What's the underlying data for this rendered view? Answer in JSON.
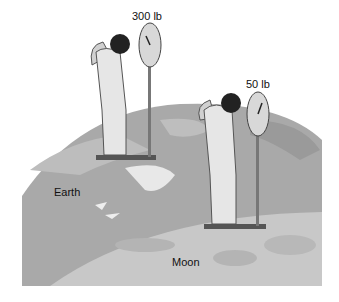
{
  "figure": {
    "earth_scale": {
      "reading": "300 lb"
    },
    "moon_scale": {
      "reading": "50 lb"
    },
    "labels": {
      "earth": "Earth",
      "moon": "Moon"
    }
  },
  "colors": {
    "earth": "#a9a9a9",
    "earth_land": "#8f8f8f",
    "moon": "#c8c8c8",
    "crater": "#b4b4b4",
    "suit": "#e6e6e6",
    "outline": "#3a3a3a"
  }
}
